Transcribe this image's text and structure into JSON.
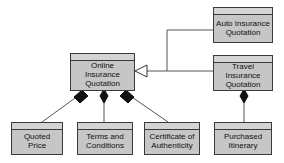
{
  "diagram": {
    "type": "uml-class-diagram",
    "background_color": "#ffffff",
    "node_fill_color": "#c6c6c6",
    "node_header_color": "#d4d4d4",
    "node_border_color": "#3a3a3a",
    "line_color": "#555555",
    "text_color": "#101010"
  },
  "nodes": [
    {
      "id": "auto_insurance_quotation",
      "label": "Auto Insurance\nQuotation",
      "x": 213,
      "y": 7,
      "w": 60,
      "h": 36
    },
    {
      "id": "travel_insurance_quotation",
      "label": "Travel Insurance\nQuotation",
      "x": 213,
      "y": 55,
      "w": 60,
      "h": 36
    },
    {
      "id": "online_insurance_quotation",
      "label": "Online Insurance\nQuotation",
      "x": 70,
      "y": 53,
      "w": 65,
      "h": 38
    },
    {
      "id": "quoted_price",
      "label": "Quoted\nPrice",
      "x": 11,
      "y": 122,
      "w": 52,
      "h": 33
    },
    {
      "id": "terms_and_conditions",
      "label": "Terms and\nConditions",
      "x": 77,
      "y": 122,
      "w": 56,
      "h": 33
    },
    {
      "id": "certificate_of_authenticity",
      "label": "Certificate of\nAuthenticity",
      "x": 144,
      "y": 122,
      "w": 56,
      "h": 33
    },
    {
      "id": "purchased_itinerary",
      "label": "Purchased\nItinerary",
      "x": 214,
      "y": 122,
      "w": 58,
      "h": 33
    }
  ],
  "edges": [
    {
      "id": "auto-generalizes-online",
      "kind": "generalization",
      "from": "auto_insurance_quotation",
      "to": "online_insurance_quotation",
      "marker": "hollow-triangle"
    },
    {
      "id": "travel-generalizes-online",
      "kind": "generalization",
      "from": "travel_insurance_quotation",
      "to": "online_insurance_quotation",
      "marker": "hollow-triangle"
    },
    {
      "id": "online-composes-quoted-price",
      "kind": "composition",
      "from": "online_insurance_quotation",
      "to": "quoted_price",
      "marker": "filled-diamond"
    },
    {
      "id": "online-composes-terms-and-conditions",
      "kind": "composition",
      "from": "online_insurance_quotation",
      "to": "terms_and_conditions",
      "marker": "filled-diamond"
    },
    {
      "id": "online-composes-certificate-of-authenticity",
      "kind": "composition",
      "from": "online_insurance_quotation",
      "to": "certificate_of_authenticity",
      "marker": "filled-diamond"
    },
    {
      "id": "travel-composes-purchased-itinerary",
      "kind": "composition",
      "from": "travel_insurance_quotation",
      "to": "purchased_itinerary",
      "marker": "filled-diamond"
    }
  ]
}
